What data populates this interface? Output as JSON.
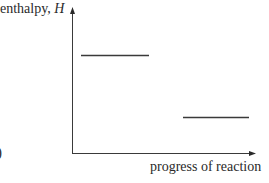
{
  "diagram": {
    "type": "enthalpy-level-diagram",
    "y_axis": {
      "label_text": "enthalpy, ",
      "label_variable": "H"
    },
    "x_axis": {
      "label": "progress of reaction"
    },
    "levels": [
      {
        "name": "reactants",
        "x1": 81,
        "x2": 149,
        "y": 55
      },
      {
        "name": "products",
        "x1": 183,
        "x2": 249,
        "y": 117
      }
    ],
    "stray_text": ")",
    "colors": {
      "line": "#3a3a3a",
      "text": "#2a2a2a",
      "background": "#ffffff"
    }
  }
}
